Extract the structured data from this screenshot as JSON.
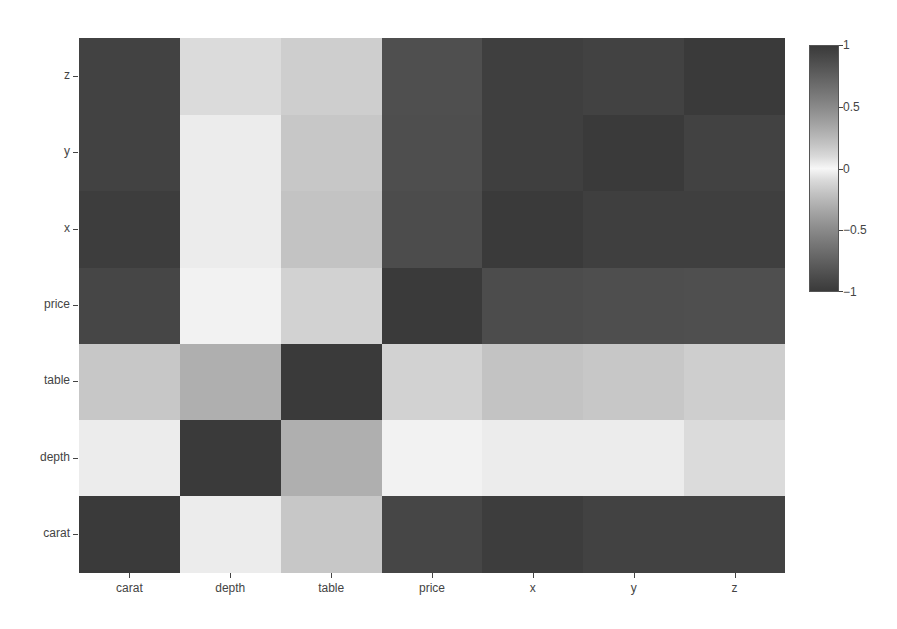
{
  "chart_data": {
    "type": "heatmap",
    "title": "",
    "xlabel": "",
    "ylabel": "",
    "x_categories": [
      "carat",
      "depth",
      "table",
      "price",
      "x",
      "y",
      "z"
    ],
    "y_categories_bottom_to_top": [
      "carat",
      "depth",
      "table",
      "price",
      "x",
      "y",
      "z"
    ],
    "matrix": [
      [
        1.0,
        0.03,
        0.18,
        0.92,
        0.98,
        0.95,
        0.95
      ],
      [
        0.03,
        1.0,
        -0.3,
        -0.01,
        -0.03,
        -0.03,
        0.09
      ],
      [
        0.18,
        -0.3,
        1.0,
        0.13,
        0.2,
        0.18,
        0.15
      ],
      [
        0.92,
        -0.01,
        0.13,
        1.0,
        0.88,
        0.87,
        0.86
      ],
      [
        0.98,
        -0.03,
        0.2,
        0.88,
        1.0,
        0.97,
        0.97
      ],
      [
        0.95,
        -0.03,
        0.18,
        0.87,
        0.97,
        1.0,
        0.95
      ],
      [
        0.95,
        0.09,
        0.15,
        0.86,
        0.97,
        0.95,
        1.0
      ]
    ],
    "colorbar": {
      "range": [
        -1,
        1
      ],
      "ticks": [
        "1",
        "0.5",
        "0",
        "−0.5",
        "−1"
      ],
      "tick_values": [
        1,
        0.5,
        0,
        -0.5,
        -1
      ],
      "colormap": "diverging gray (dark at ±1, white at 0)"
    },
    "grid": false,
    "legend_position": "right"
  },
  "colors": {
    "extreme": "#3a3a3a",
    "center": "#f7f7f7"
  }
}
